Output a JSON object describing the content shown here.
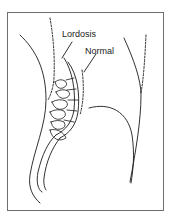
{
  "figure": {
    "title": "",
    "labels": {
      "lordosis": "Lordosis",
      "normal": "Normal"
    },
    "colors": {
      "line": "#1a1a1a",
      "frame": "#6e6e6e",
      "background": "#ffffff"
    }
  }
}
